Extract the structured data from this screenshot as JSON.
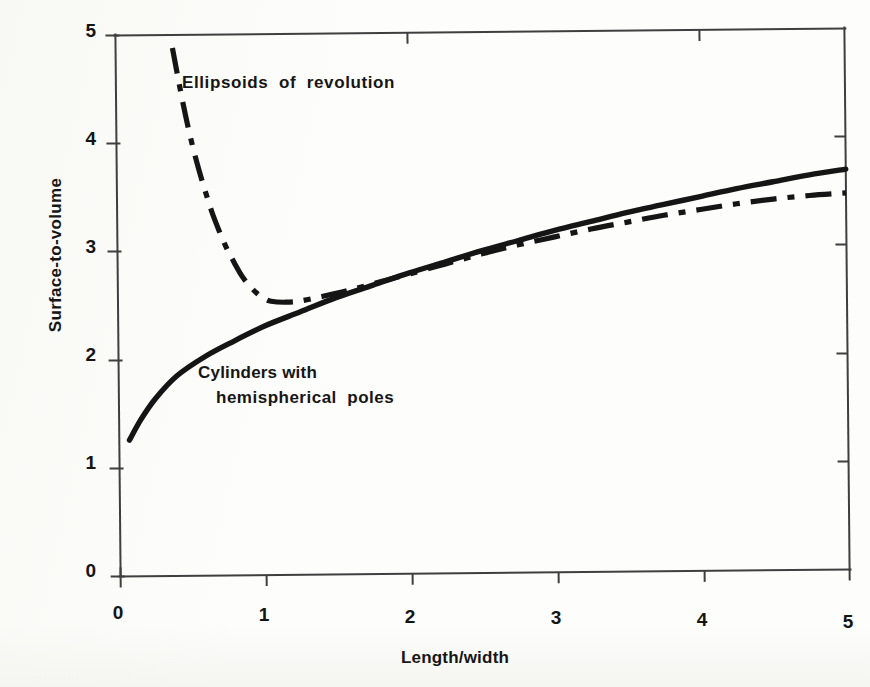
{
  "chart_data": {
    "type": "line",
    "title": "",
    "xlabel": "Length/width",
    "ylabel": "Surface-to-volume",
    "xlim": [
      0,
      5
    ],
    "ylim": [
      0,
      5
    ],
    "xticks": [
      "0",
      "1",
      "2",
      "3",
      "4",
      "5"
    ],
    "yticks": [
      "0",
      "1",
      "2",
      "3",
      "4",
      "5"
    ],
    "grid": false,
    "legend_position": "inline-annotations",
    "series": [
      {
        "name": "Cylinders with hemispherical poles",
        "style": "solid",
        "color": "#151515",
        "annotation_line1": "Cylinders with",
        "annotation_line2": "hemispherical  poles",
        "x": [
          0.07,
          0.15,
          0.25,
          0.4,
          0.6,
          0.8,
          1.0,
          1.25,
          1.5,
          1.75,
          2.0,
          2.25,
          2.5,
          2.75,
          3.0,
          3.25,
          3.5,
          3.75,
          4.0,
          4.25,
          4.5,
          4.75,
          5.0
        ],
        "y": [
          1.26,
          1.45,
          1.64,
          1.85,
          2.03,
          2.17,
          2.3,
          2.43,
          2.56,
          2.67,
          2.78,
          2.88,
          2.98,
          3.07,
          3.16,
          3.24,
          3.32,
          3.39,
          3.46,
          3.53,
          3.59,
          3.65,
          3.7
        ]
      },
      {
        "name": "Ellipsoids of revolution",
        "style": "dash-dot",
        "color": "#151515",
        "annotation_line1": "Ellipsoids  of  revolution",
        "annotation_line2": "",
        "x": [
          0.39,
          0.45,
          0.5,
          0.55,
          0.6,
          0.65,
          0.7,
          0.75,
          0.8,
          0.85,
          0.9,
          0.95,
          1.0,
          1.05,
          1.15,
          1.25,
          1.4,
          1.6,
          1.8,
          2.0,
          2.25,
          2.5,
          2.75,
          3.0,
          3.25,
          3.5,
          3.75,
          4.0,
          4.25,
          4.5,
          4.75,
          5.0
        ],
        "y": [
          4.88,
          4.43,
          4.1,
          3.82,
          3.58,
          3.36,
          3.18,
          3.02,
          2.89,
          2.77,
          2.68,
          2.61,
          2.56,
          2.53,
          2.52,
          2.53,
          2.57,
          2.63,
          2.7,
          2.77,
          2.86,
          2.95,
          3.03,
          3.1,
          3.17,
          3.23,
          3.29,
          3.34,
          3.39,
          3.43,
          3.46,
          3.48
        ]
      }
    ],
    "annotations": [
      {
        "text": "Ellipsoids  of  revolution",
        "x": 0.44,
        "y": 4.52
      },
      {
        "text": "Cylinders with",
        "x": 0.55,
        "y": 2.0
      },
      {
        "text": "hemispherical  poles",
        "x": 0.67,
        "y": 1.78
      }
    ]
  },
  "axes": {
    "x_title": "Length/width",
    "y_title": "Surface-to-volume",
    "x_tick_labels": [
      "0",
      "1",
      "2",
      "3",
      "4",
      "5"
    ],
    "y_tick_labels": [
      "0",
      "1",
      "2",
      "3",
      "4",
      "5"
    ]
  },
  "annotations": {
    "ellipsoids": "Ellipsoids  of  revolution",
    "cylinders_line1": "Cylinders with",
    "cylinders_line2": "hemispherical  poles"
  },
  "caption": "",
  "colors": {
    "ink": "#151515",
    "axis": "#3a3a3a",
    "paper": "#fdfdfb"
  }
}
